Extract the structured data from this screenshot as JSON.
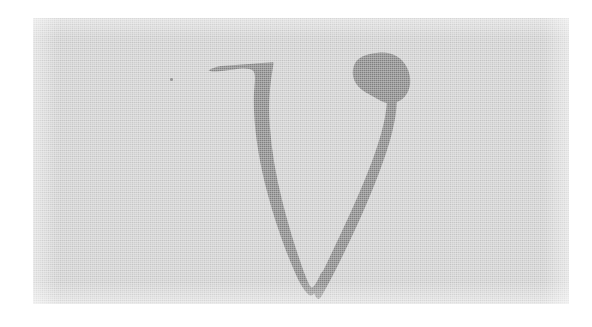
{
  "image": {
    "kind": "scanned-glyph-specimen",
    "page_background_color": "#ffffff",
    "width_px": 592,
    "height_px": 327,
    "caption": "",
    "alt_text": "Scanned italic serif lowercase letter v on gray paper"
  },
  "paper": {
    "name": "scanned-paper-region",
    "background_color": "#cfcfcf",
    "left_px": 33,
    "top_px": 18,
    "width_px": 536,
    "height_px": 286,
    "texture": "woven-paper-grain",
    "has_vignette": true
  },
  "glyph": {
    "character": "v",
    "name": "lowercase-v",
    "style": "italic-serif",
    "fill_color": "#808080",
    "stroke_features": [
      "flat-top-entry-serif",
      "pointed-left-serif-tip",
      "concave-neck",
      "thick-diagonal-stem",
      "tapered-bottom-vertex",
      "thin-hairline-upstroke",
      "ball-terminal"
    ],
    "bounds_px": {
      "left": 175,
      "top": 34,
      "width": 170,
      "height": 248
    }
  },
  "artifacts": {
    "dust_specks": [
      {
        "name": "dust-speck",
        "left_px": 137,
        "top_px": 60
      }
    ]
  }
}
